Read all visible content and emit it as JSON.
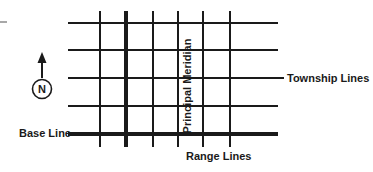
{
  "diagram": {
    "background_color": "#ffffff",
    "line_color": "#1a1a1a",
    "artifact_color": "#a8a8a8",
    "labels": {
      "township_lines": "Township Lines",
      "base_line": "Base Line",
      "range_lines": "Range Lines",
      "principal_meridian": "Principal Meridian",
      "north": "N"
    },
    "compass": {
      "letter": "N",
      "circle_center_x": 42,
      "circle_center_y": 89,
      "circle_radius": 10,
      "arrow_tip_y": 53,
      "arrow_base_y": 78
    },
    "grid": {
      "left": 68,
      "right": 278,
      "top": 11,
      "bottom": 147,
      "horizontal_lines": [
        {
          "y": 23,
          "weight": "thin",
          "x1": 68,
          "x2": 278
        },
        {
          "y": 50,
          "weight": "thin",
          "x1": 68,
          "x2": 278
        },
        {
          "y": 78,
          "weight": "thin",
          "x1": 68,
          "x2": 283
        },
        {
          "y": 106,
          "weight": "thin",
          "x1": 68,
          "x2": 278
        },
        {
          "y": 134,
          "weight": "thick",
          "x1": 68,
          "x2": 278
        }
      ],
      "vertical_lines": [
        {
          "x": 100,
          "weight": "thin",
          "y1": 11,
          "y2": 147
        },
        {
          "x": 126,
          "weight": "thick",
          "y1": 11,
          "y2": 147
        },
        {
          "x": 153,
          "weight": "thin",
          "y1": 11,
          "y2": 147
        },
        {
          "x": 178,
          "weight": "thin",
          "y1": 11,
          "y2": 147
        },
        {
          "x": 203,
          "weight": "thin",
          "y1": 11,
          "y2": 147
        },
        {
          "x": 230,
          "weight": "thin",
          "y1": 11,
          "y2": 147
        }
      ],
      "thin_stroke_width": 2,
      "thick_stroke_width": 4
    },
    "connectors": {
      "base_line_leader_x1": 68,
      "base_line_leader_x2": 100,
      "township_leader_x1": 272,
      "township_leader_x2": 284
    },
    "artifact_dash": {
      "x": 0,
      "y": 21,
      "width": 7,
      "height": 2
    }
  }
}
